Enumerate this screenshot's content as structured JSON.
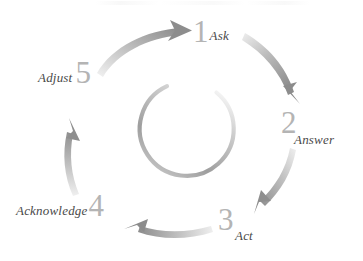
{
  "diagram": {
    "title": "",
    "type": "cyclical-process",
    "direction": "clockwise",
    "steps": [
      {
        "number": "1",
        "label": "Ask",
        "separator": "-",
        "position": "top-right"
      },
      {
        "number": "2",
        "label": "Answer",
        "separator": "",
        "position": "right"
      },
      {
        "number": "3",
        "label": "Act",
        "separator": "",
        "position": "bottom-right"
      },
      {
        "number": "4",
        "label": "Acknowledge",
        "separator": "",
        "position": "bottom-left"
      },
      {
        "number": "5",
        "label": "Adjust",
        "separator": "",
        "position": "left"
      }
    ],
    "arrows": [
      {
        "name": "arrow-adjust-to-ask",
        "from": "5",
        "to": "1"
      },
      {
        "name": "arrow-ask-to-answer",
        "from": "1",
        "to": "2"
      },
      {
        "name": "arrow-answer-to-act",
        "from": "2",
        "to": "3"
      },
      {
        "name": "arrow-act-to-acknowledge",
        "from": "3",
        "to": "4"
      },
      {
        "name": "arrow-acknowledge-to-adjust",
        "from": "4",
        "to": "5"
      }
    ],
    "inner_ring": {
      "name": "inner-ring",
      "style": "open-ring-gap-at-top"
    },
    "colors": {
      "background": "#ffffff",
      "numeral": "#b4b4b4",
      "word": "#4a4a4a",
      "arrow_dark": "#8c8c8c",
      "arrow_light": "#e8e8e8",
      "ring_dark": "#9a9a9a",
      "ring_light": "#ededed"
    }
  }
}
